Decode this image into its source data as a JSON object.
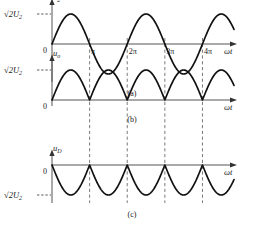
{
  "figure": {
    "axis_x_label": "ωt",
    "zero_label": "0",
    "amplitude_label": "√2U",
    "amplitude_sub": "2",
    "colors": {
      "curve": "#111111",
      "axis": "#555555",
      "dashed_guide": "#6b6b6b",
      "background": "#ffffff"
    },
    "x_ticks": [
      {
        "label": "π",
        "value": 3.14159
      },
      {
        "label": "2π",
        "value": 6.28319
      },
      {
        "label": "3π",
        "value": 9.42478
      },
      {
        "label": "4π",
        "value": 12.56637
      }
    ],
    "guide_lines_at": [
      "π",
      "2π",
      "3π",
      "4π"
    ]
  },
  "panels": [
    {
      "caption": "(a)",
      "y_label": "u",
      "y_sub": "2",
      "amplitude_label": "√2U",
      "amplitude_sub": "2",
      "zero_label": "0",
      "x_label": "ωt",
      "show_x_ticks": true,
      "chart": {
        "type": "line",
        "waveform": "sine",
        "xlim": [
          0,
          15.2
        ],
        "ylim": [
          -1.15,
          1.15
        ],
        "amplitude": 1,
        "periods": 2.4,
        "description": "Transformer secondary voltage u2 = √2U2 sin(ωt), full sinusoid crossing zero at π, 2π, 3π, 4π"
      }
    },
    {
      "caption": "(b)",
      "y_label": "u",
      "y_sub": "o",
      "amplitude_label": "√2U",
      "amplitude_sub": "2",
      "zero_label": "0",
      "x_label": "ωt",
      "show_x_ticks": false,
      "chart": {
        "type": "line",
        "waveform": "abs-sine",
        "xlim": [
          0,
          15.2
        ],
        "ylim": [
          0,
          1.15
        ],
        "amplitude": 1,
        "periods": 4.8,
        "description": "Rectified output voltage uo = |√2U2 sin(ωt)|, all humps positive, touching zero at every multiple of π"
      }
    },
    {
      "caption": "(c)",
      "y_label": "u",
      "y_sub": "D",
      "amplitude_label": "√2U",
      "amplitude_sub": "2",
      "zero_label": "0",
      "x_label": "ωt",
      "show_x_ticks": false,
      "chart": {
        "type": "line",
        "waveform": "neg-abs-sine",
        "xlim": [
          0,
          15.2
        ],
        "ylim": [
          -1.15,
          0
        ],
        "amplitude": -1,
        "periods": 4.8,
        "description": "Diode reverse voltage uD = -|√2U2 sin(ωt)|, all humps negative with minimum at -√2U2"
      }
    }
  ]
}
